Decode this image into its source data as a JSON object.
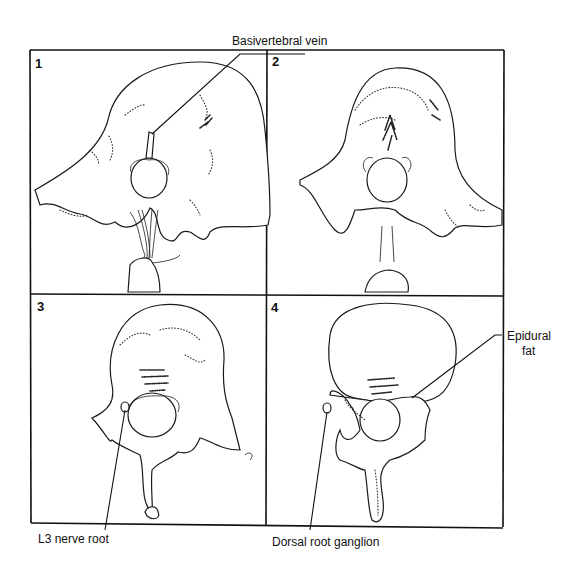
{
  "figure": {
    "type": "anatomical-diagram",
    "panels": [
      {
        "number": "1",
        "position": "top-left"
      },
      {
        "number": "2",
        "position": "top-right"
      },
      {
        "number": "3",
        "position": "bottom-left"
      },
      {
        "number": "4",
        "position": "bottom-right"
      }
    ],
    "labels": {
      "basivertebral_vein": "Basivertebral vein",
      "epidural_fat_line1": "Epidural",
      "epidural_fat_line2": "fat",
      "l3_nerve_root": "L3 nerve root",
      "dorsal_root_ganglion": "Dorsal root ganglion"
    },
    "colors": {
      "ink": "#111111",
      "background": "#ffffff"
    }
  }
}
